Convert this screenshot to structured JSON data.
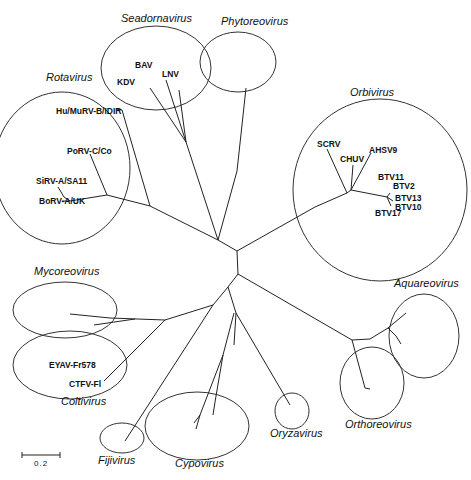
{
  "diagram": {
    "type": "unrooted phylogenetic tree",
    "scale_bar": {
      "label": "0.2"
    },
    "genera": [
      {
        "name": "Seadornavirus",
        "taxa": [
          "BAV",
          "KDV",
          "LNV"
        ]
      },
      {
        "name": "Phytoreovirus",
        "taxa": []
      },
      {
        "name": "Rotavirus",
        "taxa": [
          "Hu/MuRV-B/IDIR",
          "PoRV-C/Co",
          "SiRV-A/SA11",
          "BoRV-A/UK"
        ]
      },
      {
        "name": "Orbivirus",
        "taxa": [
          "SCRV",
          "CHUV",
          "AHSV9",
          "BTV11",
          "BTV2",
          "BTV13",
          "BTV10",
          "BTV17"
        ]
      },
      {
        "name": "Mycoreovirus",
        "taxa": []
      },
      {
        "name": "Coltivirus",
        "taxa": [
          "EYAV-Fr578",
          "CTFV-Fl"
        ]
      },
      {
        "name": "Fijivirus",
        "taxa": []
      },
      {
        "name": "Cypovirus",
        "taxa": []
      },
      {
        "name": "Oryzavirus",
        "taxa": []
      },
      {
        "name": "Orthoreovirus",
        "taxa": []
      },
      {
        "name": "Aquareovirus",
        "taxa": []
      }
    ]
  },
  "labels": {
    "seadornavirus": "Seadornavirus",
    "phytoreovirus": "Phytoreovirus",
    "rotavirus": "Rotavirus",
    "orbivirus": "Orbivirus",
    "mycoreovirus": "Mycoreovirus",
    "coltivirus": "Coltivirus",
    "fijivirus": "Fijivirus",
    "cypovirus": "Cypovirus",
    "oryzavirus": "Oryzavirus",
    "orthoreovirus": "Orthoreovirus",
    "aquareovirus": "Aquareovirus"
  },
  "taxa": {
    "bav": "BAV",
    "kdv": "KDV",
    "lnv": "LNV",
    "hu_murv": "Hu/MuRV-B/IDIR",
    "porv": "PoRV-C/Co",
    "sirv": "SiRV-A/SA11",
    "borv": "BoRV-A/UK",
    "scrv": "SCRV",
    "chuv": "CHUV",
    "ahsv9": "AHSV9",
    "btv11": "BTV11",
    "btv2": "BTV2",
    "btv13": "BTV13",
    "btv10": "BTV10",
    "btv17": "BTV17",
    "eyav": "EYAV-Fr578",
    "ctfv": "CTFV-Fl"
  },
  "scale": {
    "label": "0.2"
  }
}
